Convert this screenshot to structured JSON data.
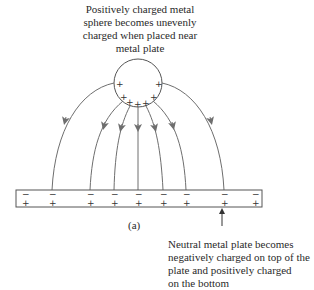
{
  "diagram": {
    "top_label": [
      "Positively charged metal",
      "sphere becomes unevenly",
      "charged when placed near",
      "metal plate"
    ],
    "bottom_label": [
      "Neutral metal plate becomes",
      "negatively charged on top of the",
      "plate and positively charged",
      "on the bottom"
    ],
    "figure_label": "(a)",
    "sphere": {
      "cx": 138,
      "cy": 83,
      "r": 24,
      "charge_sign": "+"
    },
    "plate": {
      "x": 16,
      "y": 190,
      "width": 246,
      "height": 17,
      "top_sign": "−",
      "bottom_sign": "+"
    },
    "plate_charge_positions_x": [
      25,
      52,
      90,
      114,
      138,
      163,
      186,
      224,
      255
    ],
    "field_line_endpoints_x": [
      52,
      90,
      114,
      138,
      163,
      186,
      224
    ],
    "colors": {
      "lines": "#6e6e6e",
      "text": "#2a2a2a"
    }
  }
}
